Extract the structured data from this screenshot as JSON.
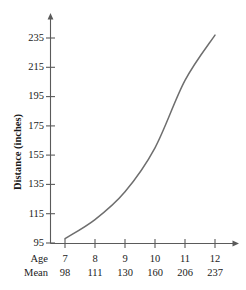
{
  "chart_data": {
    "type": "line",
    "title": "",
    "xlabel": "Age",
    "ylabel": "Distance (inches)",
    "row_labels": {
      "age": "Age",
      "mean": "Mean"
    },
    "categories": [
      "7",
      "8",
      "9",
      "10",
      "11",
      "12"
    ],
    "x": [
      7,
      8,
      9,
      10,
      11,
      12
    ],
    "values": [
      98,
      111,
      130,
      160,
      206,
      237
    ],
    "value_labels": [
      "98",
      "111",
      "130",
      "160",
      "206",
      "237"
    ],
    "yticks": [
      95,
      115,
      135,
      155,
      175,
      195,
      215,
      235
    ],
    "ytick_labels": [
      "95",
      "115",
      "135",
      "155",
      "175",
      "195",
      "215",
      "235"
    ],
    "ylim": [
      95,
      242
    ],
    "xlim": [
      7,
      12
    ],
    "grid": false,
    "legend": null,
    "line_color": "#6e6e6e",
    "axis_color": "#5a5a5a",
    "series": [
      {
        "name": "Mean distance",
        "values": [
          98,
          111,
          130,
          160,
          206,
          237
        ]
      }
    ]
  },
  "colors": {
    "line": "#6e6e6e",
    "axis": "#5a5a5a",
    "text": "#1a1a1a",
    "background": "#ffffff"
  }
}
